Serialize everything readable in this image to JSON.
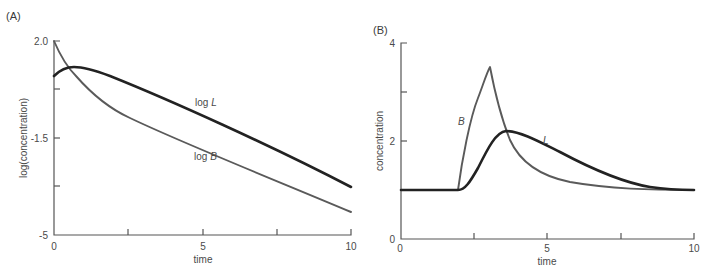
{
  "panels": {
    "a": {
      "label": "(A)",
      "ylabel": "log(concentration)",
      "xlabel": "time",
      "yticks": [
        "2.0",
        "-1.5",
        "-5"
      ],
      "xticks": [
        "0",
        "5",
        "10"
      ],
      "series_labels": {
        "L": "log L",
        "B": "log B"
      }
    },
    "b": {
      "label": "(B)",
      "ylabel": "concentration",
      "xlabel": "time",
      "yticks": [
        "4",
        "2",
        "0"
      ],
      "xticks": [
        "0",
        "5",
        "10"
      ],
      "series_labels": {
        "L": "L",
        "B": "B"
      }
    }
  },
  "colors": {
    "L": "#222222",
    "B": "#5a5a5a",
    "axis": "#555555"
  },
  "chart_data": [
    {
      "type": "line",
      "title": "(A)",
      "xlabel": "time",
      "ylabel": "log(concentration)",
      "xlim": [
        0,
        10
      ],
      "ylim": [
        -5,
        2.0
      ],
      "yticks": [
        2.0,
        -1.5,
        -5
      ],
      "xticks": [
        0,
        5,
        10
      ],
      "grid": false,
      "legend": "inline labels",
      "x": [
        0,
        0.25,
        0.5,
        0.75,
        1,
        1.5,
        2,
        3,
        4,
        5,
        6,
        7,
        8,
        9,
        10
      ],
      "series": [
        {
          "name": "log L",
          "values": [
            0.74,
            0.95,
            1.02,
            1.03,
            1.0,
            0.9,
            0.78,
            0.52,
            0.23,
            -0.06,
            -0.38,
            -0.68,
            -0.99,
            -1.32,
            -1.64
          ]
        },
        {
          "name": "log B",
          "values": [
            2.0,
            1.6,
            1.25,
            0.98,
            0.76,
            0.42,
            0.15,
            -0.3,
            -0.68,
            -1.05,
            -1.43,
            -1.83,
            -2.2,
            -2.58,
            -2.96
          ]
        }
      ]
    },
    {
      "type": "line",
      "title": "(B)",
      "xlabel": "time",
      "ylabel": "concentration",
      "xlim": [
        0,
        10
      ],
      "ylim": [
        0,
        4
      ],
      "yticks": [
        0,
        2,
        4
      ],
      "xticks": [
        0,
        5,
        10
      ],
      "grid": false,
      "legend": "inline labels",
      "x": [
        0,
        1,
        2,
        2.5,
        3,
        3.1,
        3.5,
        3.6,
        4,
        5,
        6,
        7,
        8,
        9,
        10
      ],
      "series": [
        {
          "name": "L",
          "values": [
            1.0,
            1.0,
            1.0,
            1.45,
            2.0,
            2.1,
            2.18,
            2.2,
            2.15,
            1.8,
            1.5,
            1.27,
            1.13,
            1.06,
            1.03
          ]
        },
        {
          "name": "B",
          "values": [
            1.0,
            1.0,
            1.0,
            2.5,
            3.35,
            3.5,
            2.7,
            2.5,
            1.95,
            1.4,
            1.18,
            1.08,
            1.04,
            1.02,
            1.01
          ]
        }
      ]
    }
  ]
}
